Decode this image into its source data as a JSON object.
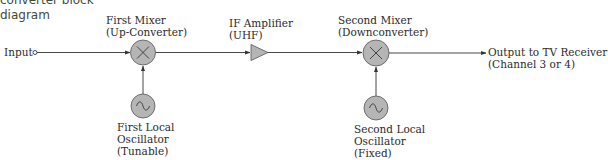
{
  "caption": {
    "line1": "converter block",
    "line2": "diagram"
  },
  "diagram": {
    "input_label": "Input",
    "output_label": {
      "line1": "Output to TV Receiver",
      "line2": "(Channel 3 or 4)"
    },
    "blocks": [
      {
        "id": "first_mixer",
        "type": "mixer",
        "symbol": "multiply-x",
        "line1": "First Mixer",
        "line2": "(Up-Converter)"
      },
      {
        "id": "if_amplifier",
        "type": "amplifier",
        "symbol": "triangle",
        "line1": "IF Amplifier",
        "line2": "(UHF)"
      },
      {
        "id": "second_mixer",
        "type": "mixer",
        "symbol": "multiply-x",
        "line1": "Second Mixer",
        "line2": "(Downconverter)"
      },
      {
        "id": "first_lo",
        "type": "oscillator",
        "symbol": "sine-wave",
        "line1": "First Local",
        "line2": "Oscillator",
        "line3": "(Tunable)"
      },
      {
        "id": "second_lo",
        "type": "oscillator",
        "symbol": "sine-wave",
        "line1": "Second Local",
        "line2": "Oscillator",
        "line3": "(Fixed)"
      }
    ],
    "colors": {
      "block_fill": "#b5b5b5",
      "line": "#333333"
    }
  }
}
